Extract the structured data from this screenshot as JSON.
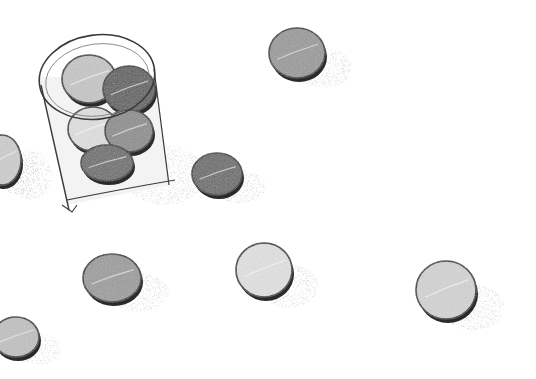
{
  "illustration": {
    "style": "pencil sketch, grayscale",
    "background": "#ffffff",
    "glass": {
      "rim": {
        "cx": 97,
        "cy": 77,
        "rx": 58,
        "ry": 42
      },
      "stroke": "#3a3a3a",
      "tokens_inside": [
        {
          "cx": 89,
          "cy": 79,
          "rx": 27,
          "ry": 24,
          "fill": "#c8c8c8"
        },
        {
          "cx": 129,
          "cy": 89,
          "rx": 26,
          "ry": 23,
          "fill": "#5a5a5a"
        },
        {
          "cx": 93,
          "cy": 129,
          "rx": 25,
          "ry": 22,
          "fill": "#e2e2e2"
        },
        {
          "cx": 129,
          "cy": 131,
          "rx": 24,
          "ry": 21,
          "fill": "#8c8c8c"
        },
        {
          "cx": 107,
          "cy": 163,
          "rx": 26,
          "ry": 18,
          "fill": "#6a6a6a"
        }
      ]
    },
    "tokens": [
      {
        "name": "token-dark-near-glass",
        "cx": 217,
        "cy": 174,
        "rx": 25,
        "ry": 21,
        "fill": "#686868"
      },
      {
        "name": "token-top-right",
        "cx": 297,
        "cy": 53,
        "rx": 28,
        "ry": 25,
        "fill": "#9a9a9a"
      },
      {
        "name": "token-left-edge",
        "cx": 2,
        "cy": 160,
        "rx": 19,
        "ry": 25,
        "fill": "#cfcfcf"
      },
      {
        "name": "token-bottom-left-middle",
        "cx": 112,
        "cy": 278,
        "rx": 29,
        "ry": 24,
        "fill": "#9c9c9c"
      },
      {
        "name": "token-bottom-center",
        "cx": 264,
        "cy": 270,
        "rx": 28,
        "ry": 27,
        "fill": "#e4e4e4"
      },
      {
        "name": "token-bottom-right",
        "cx": 446,
        "cy": 290,
        "rx": 30,
        "ry": 29,
        "fill": "#d6d6d6"
      },
      {
        "name": "token-bottom-left-corner",
        "cx": 16,
        "cy": 337,
        "rx": 23,
        "ry": 20,
        "fill": "#c2c2c2"
      }
    ]
  }
}
